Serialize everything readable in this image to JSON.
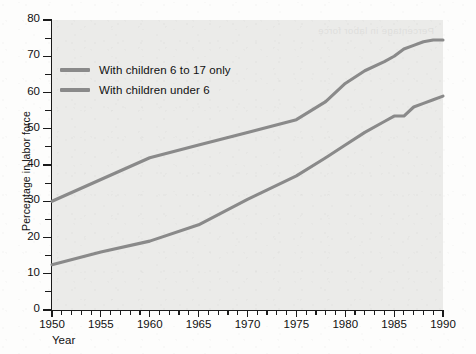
{
  "chart_data": {
    "type": "line",
    "title": "",
    "subtitle": "",
    "xlabel": "Year",
    "ylabel": "Percentage in labor force",
    "xlim": [
      1950,
      1990
    ],
    "ylim": [
      0,
      80
    ],
    "grid": false,
    "legend_position": "inside upper-left",
    "x_major_ticks": [
      1950,
      1955,
      1960,
      1965,
      1970,
      1975,
      1980,
      1985,
      1990
    ],
    "x_tick_labels": [
      "1950",
      "1955",
      "1960",
      "1965",
      "1970",
      "1975",
      "1980",
      "1985",
      "1990"
    ],
    "x_minor_tick_step": 1,
    "y_major_ticks": [
      0,
      10,
      20,
      30,
      40,
      50,
      60,
      70,
      80
    ],
    "y_tick_labels": [
      "0",
      "10",
      "20",
      "30",
      "40",
      "50",
      "60",
      "70",
      "80"
    ],
    "y_minor_ticks": [
      5,
      15,
      25,
      35,
      45,
      55,
      65,
      75
    ],
    "x": [
      1950,
      1955,
      1960,
      1965,
      1970,
      1975,
      1978,
      1980,
      1982,
      1984,
      1985,
      1986,
      1987,
      1988,
      1989,
      1990
    ],
    "series": [
      {
        "name": "With children 6 to 17 only",
        "color": "#8a8a8a",
        "values": [
          30,
          36,
          42,
          45.5,
          49,
          52.5,
          57.5,
          62.5,
          66,
          68.5,
          70,
          72,
          73,
          74,
          74.5,
          74.5
        ]
      },
      {
        "name": "With children under 6",
        "color": "#8a8a8a",
        "values": [
          12.5,
          16,
          19,
          23.5,
          30.5,
          37,
          42,
          45.5,
          49,
          52,
          53.5,
          53.5,
          56,
          57,
          58,
          59
        ]
      }
    ]
  },
  "legend": {
    "items": [
      {
        "label": "With children 6 to 17 only",
        "color": "#8a8a8a"
      },
      {
        "label": "With children under 6",
        "color": "#8a8a8a"
      }
    ]
  },
  "artifacts": {
    "bleed_through_text": "Percentage in labor force"
  },
  "colors": {
    "plot_background": "#ebebe9",
    "figure_background": "#fdfdfc",
    "axis": "#1a1a1a",
    "text": "#111111",
    "series_line": "#8a8a8a"
  }
}
